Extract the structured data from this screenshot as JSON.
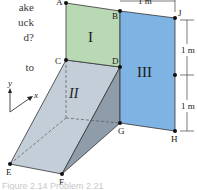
{
  "side_text": {
    "lines": [
      "ake",
      "uck",
      "d?",
      "",
      "to"
    ]
  },
  "figure": {
    "regions": {
      "I": {
        "label": "I",
        "color": "#b9d9b4"
      },
      "II": {
        "label": "II",
        "color": "#c6d1dc",
        "side_color": "#8c9aa8"
      },
      "III": {
        "label": "III",
        "color": "#7fb3e3"
      }
    },
    "points": {
      "A": "A",
      "B": "B",
      "C": "C",
      "D": "D",
      "E": "E",
      "F": "F",
      "G": "G",
      "H": "H",
      "J": "J"
    },
    "dimensions": {
      "top": "1 m",
      "right_upper": "1 m",
      "right_lower": "1 m"
    },
    "axes": {
      "y": "y",
      "x": "x"
    }
  },
  "caption": "Figure 2.14 Problem 2.21"
}
